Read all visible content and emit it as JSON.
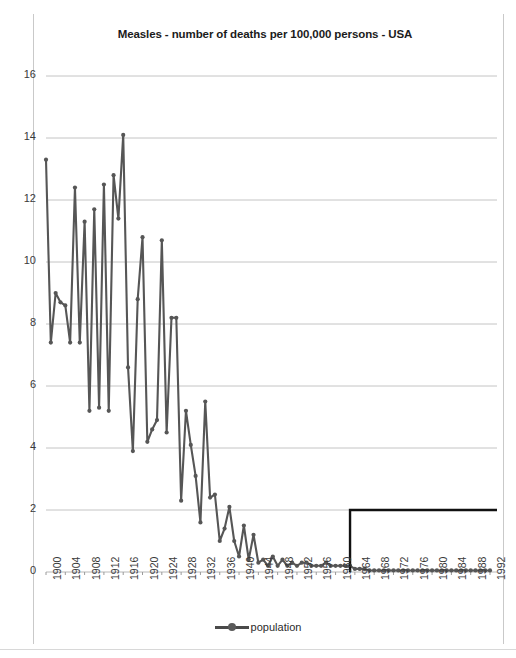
{
  "chart_data": {
    "type": "line",
    "title": "Measles - number of deaths per 100,000  persons - USA",
    "xlabel": "",
    "ylabel": "",
    "xlim": [
      1900,
      1992
    ],
    "ylim": [
      0,
      16
    ],
    "ytick_step": 2,
    "xtick_step": 4,
    "grid": true,
    "legend_position": "bottom",
    "series": [
      {
        "name": "population",
        "color": "#565656",
        "marker": "circle",
        "x": [
          1900,
          1901,
          1902,
          1903,
          1904,
          1905,
          1906,
          1907,
          1908,
          1909,
          1910,
          1911,
          1912,
          1913,
          1914,
          1915,
          1916,
          1917,
          1918,
          1919,
          1920,
          1921,
          1922,
          1923,
          1924,
          1925,
          1926,
          1927,
          1928,
          1929,
          1930,
          1931,
          1932,
          1933,
          1934,
          1935,
          1936,
          1937,
          1938,
          1939,
          1940,
          1941,
          1942,
          1943,
          1944,
          1945,
          1946,
          1947,
          1948,
          1949,
          1950,
          1951,
          1952,
          1953,
          1954,
          1955,
          1956,
          1957,
          1958,
          1959,
          1960,
          1961,
          1962,
          1963,
          1964,
          1965,
          1966,
          1967,
          1968,
          1969,
          1970,
          1971,
          1972,
          1973,
          1974,
          1975,
          1976,
          1977,
          1978,
          1979,
          1980,
          1981,
          1982,
          1983,
          1984,
          1985,
          1986,
          1987,
          1988,
          1989,
          1990,
          1991,
          1992
        ],
        "y": [
          13.3,
          7.4,
          9.0,
          8.7,
          8.6,
          7.4,
          12.4,
          7.4,
          11.3,
          5.2,
          11.7,
          5.3,
          12.5,
          5.2,
          12.8,
          11.4,
          14.1,
          6.6,
          3.9,
          8.8,
          10.8,
          4.2,
          4.6,
          4.9,
          10.7,
          4.5,
          8.2,
          8.2,
          2.3,
          5.2,
          4.1,
          3.1,
          1.6,
          5.5,
          2.4,
          2.5,
          1.0,
          1.4,
          2.1,
          1.0,
          0.5,
          1.5,
          0.4,
          1.2,
          0.3,
          0.4,
          0.2,
          0.5,
          0.2,
          0.4,
          0.2,
          0.3,
          0.2,
          0.3,
          0.3,
          0.2,
          0.2,
          0.2,
          0.3,
          0.2,
          0.2,
          0.2,
          0.2,
          0.2,
          0.1,
          0.1,
          0.1,
          0.05,
          0.05,
          0.05,
          0.05,
          0.05,
          0.05,
          0.05,
          0.05,
          0.05,
          0.05,
          0.05,
          0.05,
          0.05,
          0.05,
          0.05,
          0.05,
          0.05,
          0.05,
          0.05,
          0.05,
          0.05,
          0.05,
          0.05,
          0.05,
          0.05,
          0.05
        ]
      }
    ],
    "yticks": [
      "0",
      "2",
      "4",
      "6",
      "8",
      "10",
      "12",
      "14",
      "16"
    ],
    "xticks": [
      "1900",
      "1904",
      "1908",
      "1912",
      "1916",
      "1920",
      "1924",
      "1928",
      "1932",
      "1936",
      "1940",
      "1944",
      "1948",
      "1952",
      "1956",
      "1960",
      "1964",
      "1968",
      "1972",
      "1976",
      "1980",
      "1984",
      "1988",
      "1992"
    ],
    "annotation": {
      "name": "vaccine-introduction-marker",
      "type": "elbow-line",
      "color": "#111111",
      "x": 1963,
      "y_top": 2.0,
      "extends_to_x": 1992
    }
  },
  "legend": {
    "entries": [
      {
        "label": "population",
        "color": "#565656"
      }
    ]
  }
}
